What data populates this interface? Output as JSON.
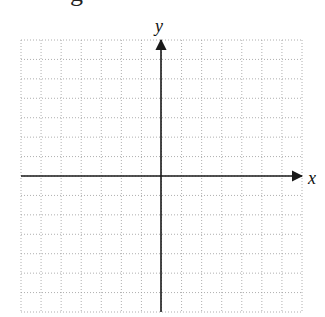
{
  "diagram": {
    "type": "blank coordinate plane",
    "top_fragment_text": "g",
    "axes": {
      "x_label": "x",
      "y_label": "y",
      "color": "#1a1a1a"
    },
    "grid": {
      "columns": 14,
      "rows": 14,
      "style": "dotted",
      "color": "#9a9a9a",
      "left": 21,
      "top": 40,
      "right": 302,
      "bottom": 312
    },
    "origin": {
      "px_x": 161,
      "px_y": 176
    }
  }
}
